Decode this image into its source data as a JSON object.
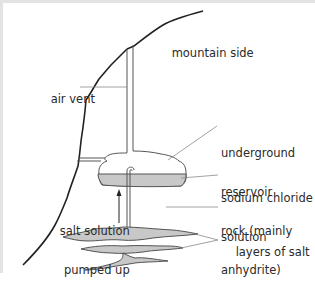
{
  "diagram": {
    "type": "cross-section",
    "colors": {
      "line": "#222222",
      "leader": "#8a8a8a",
      "fill": "#c8c8c8",
      "frame": "#e3e3e3"
    },
    "labels": {
      "mountain_side": "mountain side",
      "air_vent": "air vent",
      "underground_reservoir_1": "underground",
      "underground_reservoir_2": "reservoir",
      "sodium_chloride_1": "sodium chloride",
      "sodium_chloride_2": "solution",
      "salt_solution_1": "salt solution",
      "salt_solution_2": "pumped up",
      "rock_1": "rock (mainly",
      "rock_2": "anhydrite)",
      "layers_of_salt": "layers of salt"
    }
  }
}
